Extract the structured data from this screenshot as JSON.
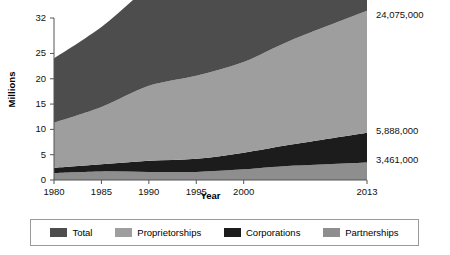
{
  "chart_data": {
    "type": "area",
    "stacked": true,
    "title": "",
    "xlabel": "Year",
    "ylabel": "Millions",
    "x": [
      1980,
      1985,
      1990,
      1995,
      2000,
      2005,
      2013
    ],
    "xtick_labels": [
      "1980",
      "1985",
      "1990",
      "1995",
      "2000",
      "2013"
    ],
    "xtick_values": [
      1980,
      1985,
      1990,
      1995,
      2000,
      2013
    ],
    "ytick_labels": [
      "0",
      "5",
      "10",
      "15",
      "20",
      "25",
      "32"
    ],
    "ytick_values": [
      0,
      5,
      10,
      15,
      20,
      25,
      32
    ],
    "xlim": [
      1980,
      2013
    ],
    "ylim": [
      0,
      32
    ],
    "grid": false,
    "legend_position": "bottom",
    "series": [
      {
        "name": "Partnerships",
        "color": "#8e8e8e",
        "order": 1,
        "values": [
          1.4,
          1.7,
          1.6,
          1.6,
          2.1,
          2.8,
          3.461
        ]
      },
      {
        "name": "Corporations",
        "color": "#1c1c1c",
        "order": 2,
        "values": [
          1.0,
          1.4,
          2.2,
          2.6,
          3.3,
          4.2,
          5.888
        ]
      },
      {
        "name": "Proprietorships",
        "color": "#9e9e9e",
        "order": 3,
        "values": [
          8.9,
          11.3,
          14.8,
          16.4,
          17.9,
          20.6,
          24.075
        ]
      },
      {
        "name": "Total",
        "color": "#4d4d4d",
        "order": 4,
        "values": [
          12.7,
          15.8,
          19.3,
          21.1,
          24.6,
          28.4,
          33.424
        ]
      }
    ],
    "annotations": [
      {
        "label": "33,424,000",
        "value": 33424000
      },
      {
        "label": "24,075,000",
        "value": 24075000
      },
      {
        "label": "5,888,000",
        "value": 5888000
      },
      {
        "label": "3,461,000",
        "value": 3461000
      }
    ]
  },
  "legend": {
    "items": [
      {
        "label": "Total",
        "color": "#4d4d4d"
      },
      {
        "label": "Proprietorships",
        "color": "#9e9e9e"
      },
      {
        "label": "Corporations",
        "color": "#1c1c1c"
      },
      {
        "label": "Partnerships",
        "color": "#8e8e8e"
      }
    ]
  }
}
